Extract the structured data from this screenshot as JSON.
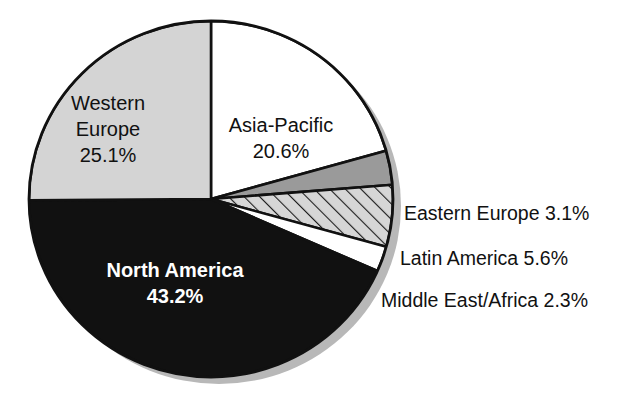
{
  "chart_data": {
    "type": "pie",
    "title": "",
    "subtitle": "",
    "xlabel": "",
    "ylabel": "",
    "legend_position": "none",
    "grid": false,
    "units": "percent",
    "start_angle_deg": 0,
    "direction": "clockwise",
    "categories": [
      "Asia-Pacific",
      "Eastern Europe",
      "Latin America",
      "Middle East/Africa",
      "North America",
      "Western Europe"
    ],
    "values": [
      20.6,
      3.1,
      5.6,
      2.3,
      43.2,
      25.1
    ],
    "slices": [
      {
        "name": "Asia-Pacific",
        "value": 20.6,
        "value_label": "20.6%",
        "fill": "white",
        "fill_color": "#ffffff",
        "label_placement": "inside",
        "label_lines": [
          "Asia-Pacific",
          "20.6%"
        ]
      },
      {
        "name": "Eastern Europe",
        "value": 3.1,
        "value_label": "3.1%",
        "fill": "solid-gray",
        "fill_color": "#9a9a9a",
        "label_placement": "outside-right",
        "label_text": "Eastern Europe 3.1%"
      },
      {
        "name": "Latin America",
        "value": 5.6,
        "value_label": "5.6%",
        "fill": "diagonal-hatch",
        "fill_color": "#cccccc",
        "label_placement": "outside-right",
        "label_text": "Latin America 5.6%"
      },
      {
        "name": "Middle East/Africa",
        "value": 2.3,
        "value_label": "2.3%",
        "fill": "white",
        "fill_color": "#ffffff",
        "label_placement": "outside-right",
        "label_text": "Middle East/Africa 2.3%"
      },
      {
        "name": "North America",
        "value": 43.2,
        "value_label": "43.2%",
        "fill": "black",
        "fill_color": "#111111",
        "label_placement": "inside",
        "label_lines": [
          "North America",
          "43.2%"
        ]
      },
      {
        "name": "Western Europe",
        "value": 25.1,
        "value_label": "25.1%",
        "fill": "light-gray",
        "fill_color": "#d4d4d4",
        "label_placement": "inside",
        "label_lines": [
          "Western",
          "Europe",
          "25.1%"
        ]
      }
    ]
  },
  "labels": {
    "western_europe": {
      "line1": "Western",
      "line2": "Europe",
      "line3": "25.1%"
    },
    "asia_pacific": {
      "line1": "Asia-Pacific",
      "line2": "20.6%"
    },
    "north_america": {
      "line1": "North America",
      "line2": "43.2%"
    },
    "eastern_europe": "Eastern Europe 3.1%",
    "latin_america": "Latin America 5.6%",
    "middle_east_africa": "Middle East/Africa 2.3%"
  },
  "colors": {
    "black_slice": "#111111",
    "light_gray_slice": "#d4d4d4",
    "mid_gray_slice": "#9a9a9a",
    "hatch_gray": "#cfcfcf",
    "white_slice": "#ffffff",
    "outline": "#111111",
    "shadow": "#b4b4b4",
    "background": "#ffffff"
  }
}
